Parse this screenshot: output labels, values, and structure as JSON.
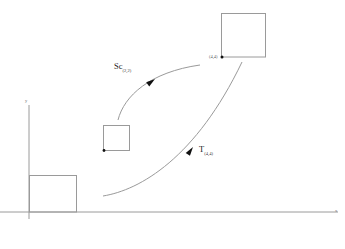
{
  "diagram": {
    "type": "commutative-mapping-diagram",
    "axes": {
      "x_label": "x",
      "y_label": "y",
      "x_axis": {
        "x1": 0,
        "y1": 212,
        "x2": 338,
        "y2": 212
      },
      "y_axis": {
        "x1": 29,
        "y1": 105,
        "x2": 29,
        "y2": 219
      }
    },
    "squares": [
      {
        "name": "origin-square",
        "x": 29,
        "y": 175,
        "width": 47,
        "height": 37,
        "has_corner_dot": false,
        "corner_label": ""
      },
      {
        "name": "middle-square",
        "x": 103,
        "y": 125,
        "width": 26,
        "height": 25,
        "has_corner_dot": true,
        "corner_label": ""
      },
      {
        "name": "large-square",
        "x": 221,
        "y": 13,
        "width": 44,
        "height": 44,
        "has_corner_dot": true,
        "corner_label": "(4,4)"
      }
    ],
    "arrows": [
      {
        "name": "scale-arrow",
        "label": "Sc",
        "subscript": "(2,2)",
        "label_x": 114,
        "label_y": 62,
        "path": "M 118 120 C 124 96, 150 72, 200 65",
        "head_x": 155,
        "head_y": 79,
        "head_angle": -36
      },
      {
        "name": "translate-arrow",
        "label": "T",
        "subscript": "(4,4)",
        "label_x": 199,
        "label_y": 145,
        "path": "M 103 196 C 140 190, 196 158, 242 62",
        "head_x": 193,
        "head_y": 147,
        "head_angle": -55
      }
    ]
  }
}
